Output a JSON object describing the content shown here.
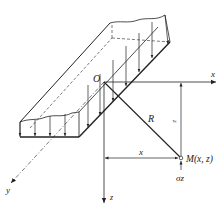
{
  "diagram": {
    "labels": {
      "origin": "O",
      "x_axis": "x",
      "y_axis": "y",
      "z_axis": "z",
      "radius": "R",
      "dim_x": "x",
      "dim_z": "z",
      "point": "M(x, z)",
      "stress": "σz"
    },
    "colors": {
      "stroke": "#222222",
      "background": "#ffffff"
    }
  }
}
